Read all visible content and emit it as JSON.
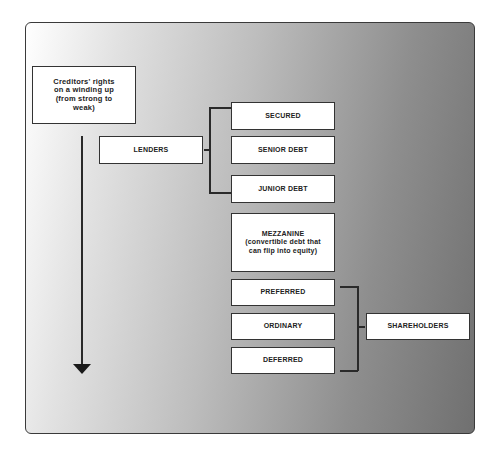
{
  "diagram": {
    "title_box": "Creditors' rights on a winding up (from strong to weak)",
    "lenders": {
      "label": "LENDERS",
      "items": [
        "SECURED",
        "SENIOR DEBT",
        "JUNIOR DEBT"
      ]
    },
    "mezzanine": {
      "title": "MEZZANINE",
      "description": "(convertible debt that can flip into equity)"
    },
    "shareholders": {
      "label": "SHAREHOLDERS",
      "items": [
        "PREFERRED",
        "ORDINARY",
        "DEFERRED"
      ]
    },
    "arrow_direction": "down"
  },
  "colors": {
    "box_fill": "#ffffff",
    "border": "#333333",
    "gradient_light": "#ffffff",
    "gradient_dark": "#707070"
  }
}
